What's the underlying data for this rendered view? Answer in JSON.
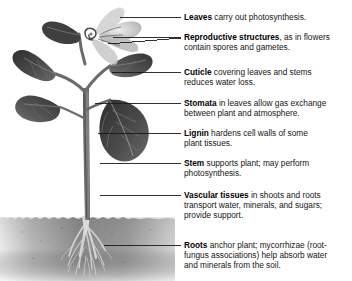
{
  "figure": {
    "width": 352,
    "height": 281,
    "background_color": "#ffffff",
    "text_color": "#161616",
    "leader_color": "#1a1a1a"
  },
  "illustration": {
    "name": "plant-photograph",
    "style": "grayscale photograph",
    "description": "Flowering plant with broad heart-shaped leaves, pale flower cluster, upright stem, and fibrous root system in soil",
    "soil_surface_y": 218,
    "soil_color_dark": "#8d8d8d",
    "soil_color_light": "#e8e8e8",
    "leaf_color_dark": "#3a3a3a",
    "leaf_color_mid": "#5c5c5c",
    "stem_color": "#6f6f6f",
    "flower_color": "#cfcfcf",
    "root_color": "#b9b9b9",
    "parts": [
      {
        "name": "upper-left-leaf",
        "label": "leaf"
      },
      {
        "name": "upper-right-leaf",
        "label": "leaf"
      },
      {
        "name": "lower-left-leaf",
        "label": "leaf"
      },
      {
        "name": "lower-right-leaf",
        "label": "leaf"
      },
      {
        "name": "flower-cluster",
        "label": "flower"
      },
      {
        "name": "main-stem",
        "label": "stem"
      },
      {
        "name": "soil-band",
        "label": "soil"
      },
      {
        "name": "root-system",
        "label": "roots"
      }
    ]
  },
  "callouts": [
    {
      "id": "leaves",
      "term": "Leaves",
      "desc": " carry out photosynthesis.",
      "text_y": 12,
      "leader_y": 17,
      "leader_x_start": 120,
      "leader_x_end": 181
    },
    {
      "id": "reproductive-structures",
      "term": "Reproductive structures",
      "desc": ", as in flowers",
      "cont": "contain spores and gametes.",
      "text_y": 32,
      "leader_y": 37,
      "leader_x_start": 113,
      "leader_x_end": 181,
      "second_leader": {
        "x_start": 113,
        "y_start": 43,
        "x_end": 181,
        "y_end": 37
      }
    },
    {
      "id": "cuticle",
      "term": "Cuticle",
      "desc": " covering leaves and stems",
      "cont": "reduces water loss.",
      "text_y": 67,
      "leader_y": 72,
      "leader_x_start": 112,
      "leader_x_end": 181
    },
    {
      "id": "stomata",
      "term": "Stomata",
      "desc": " in leaves allow gas exchange",
      "cont": "between plant and atmosphere.",
      "text_y": 98,
      "leader_y": 103,
      "leader_x_start": 95,
      "leader_x_end": 181
    },
    {
      "id": "lignin",
      "term": "Lignin",
      "desc": " hardens cell walls of some",
      "cont": "plant tissues.",
      "text_y": 128,
      "leader_y": 133,
      "leader_x_start": 98,
      "leader_x_end": 181
    },
    {
      "id": "stem",
      "term": "Stem",
      "desc": " supports plant; may perform",
      "cont": "photosynthesis.",
      "text_y": 158,
      "leader_y": 163,
      "leader_x_start": 100,
      "leader_x_end": 181
    },
    {
      "id": "vascular-tissues",
      "term": "Vascular tissues",
      "desc": " in shoots and roots",
      "cont": "transport water, minerals, and sugars;",
      "cont2": "provide support.",
      "text_y": 190,
      "leader_y": 195,
      "leader_x_start": 100,
      "leader_x_end": 181
    },
    {
      "id": "roots",
      "term": "Roots",
      "desc": " anchor plant; mycorrhizae (root-",
      "cont": "fungus associations) help absorb water",
      "cont2": "and minerals from the soil.",
      "text_y": 240,
      "leader_y": 245,
      "leader_x_start": 104,
      "leader_x_end": 181
    }
  ]
}
